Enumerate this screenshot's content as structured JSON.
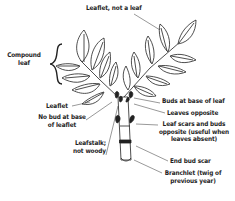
{
  "diagram": {
    "labels": {
      "leaflet_not_leaf": "Leaflet, not a leaf",
      "compound_leaf_line1": "Compound",
      "compound_leaf_line2": "leaf",
      "leaflet": "Leaflet",
      "no_bud_line1": "No bud at base",
      "no_bud_line2": "of leaflet",
      "leafstalk_line1": "Leafstalk;",
      "leafstalk_line2": "not woody",
      "buds_at_base": "Buds at base of leaf",
      "leaves_opposite": "Leaves opposite",
      "leaf_scars_line1": "Leaf scars and buds",
      "leaf_scars_line2": "opposite (useful when",
      "leaf_scars_line3": "leaves absent)",
      "end_bud_scar": "End bud scar",
      "branchlet_line1": "Branchlet (twig of",
      "branchlet_line2": "previous year)"
    },
    "colors": {
      "ink": "#222222",
      "background": "#ffffff"
    }
  }
}
